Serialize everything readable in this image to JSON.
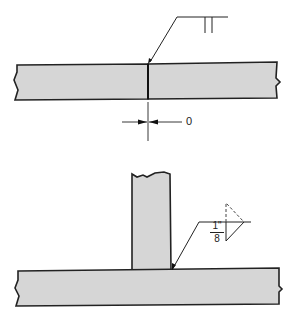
{
  "diagram": {
    "type": "weld-symbol-drawing",
    "colors": {
      "plate_fill": "#d6d6d6",
      "stroke": "#222222",
      "background": "#ffffff"
    },
    "top_view": {
      "description": "Square groove butt joint with zero root opening",
      "weld_symbol": "square-groove",
      "root_opening_label": "0"
    },
    "bottom_view": {
      "description": "Fillet weld on T-joint, both sides (other side dashed)",
      "weld_symbol": "fillet",
      "size_numerator": "1\"",
      "size_denominator": "8"
    }
  }
}
